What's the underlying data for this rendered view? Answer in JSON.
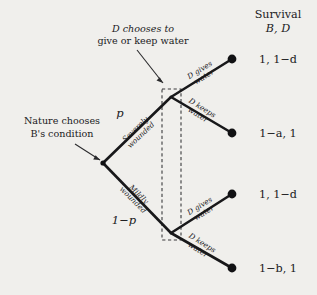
{
  "figure": {
    "type": "extensive-form-game-tree",
    "background_color": "#f0efec",
    "line_color": "#18181a",
    "header": {
      "line1": "Survival",
      "line2": "B, D"
    },
    "annotations": [
      {
        "id": "d-choice-note",
        "line1": "D chooses to",
        "line2": "give or keep water",
        "points_to": "upper-decision-node"
      },
      {
        "id": "nature-note",
        "line1": "Nature chooses",
        "line2": "B's condition",
        "points_to": "root-node"
      }
    ],
    "probabilities": {
      "upper": "p",
      "lower": "1−p"
    },
    "nature_branches": [
      {
        "id": "severely-wounded",
        "line1": "Severely",
        "line2": "wounded",
        "probability": "p"
      },
      {
        "id": "mildly-wounded",
        "line1": "Mildly",
        "line2": "wounded",
        "probability": "1−p"
      }
    ],
    "decision_branches": [
      {
        "id": "upper-gives",
        "line1": "D gives",
        "line2": "water"
      },
      {
        "id": "upper-keeps",
        "line1": "D keeps",
        "line2": "water"
      },
      {
        "id": "lower-gives",
        "line1": "D gives",
        "line2": "water"
      },
      {
        "id": "lower-keeps",
        "line1": "D keeps",
        "line2": "water"
      }
    ],
    "payoffs": [
      {
        "id": "payoff-1",
        "label": "1, 1−d"
      },
      {
        "id": "payoff-2",
        "label": "1−a, 1"
      },
      {
        "id": "payoff-3",
        "label": "1, 1−d"
      },
      {
        "id": "payoff-4",
        "label": "1−b, 1"
      }
    ],
    "information_set": {
      "id": "d-information-set",
      "style": "dashed-rectangle"
    }
  }
}
